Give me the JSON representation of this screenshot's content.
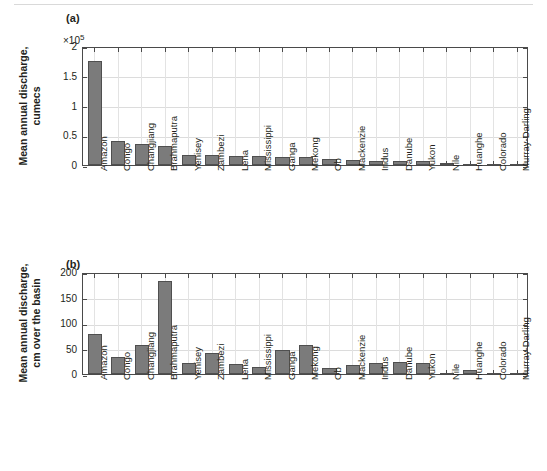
{
  "figure": {
    "panel_a_tag": "(a)",
    "panel_b_tag": "(b)"
  },
  "chart_data": [
    {
      "type": "bar",
      "panel": "(a)",
      "title": "",
      "xlabel": "",
      "ylabel": "Mean annual discharge, cumecs",
      "ylabel_line1": "Mean annual discharge,",
      "ylabel_line2": "cumecs",
      "multiplier": "×10⁵",
      "multiplier_base": "×10",
      "multiplier_exp": "5",
      "ylim": [
        0,
        2
      ],
      "yticks": [
        0,
        0.5,
        1,
        1.5,
        2
      ],
      "ytick_labels": [
        "0",
        "0.5",
        "1",
        "1.5",
        "2"
      ],
      "grid": true,
      "units": "cumecs (×10^5)",
      "categories": [
        "Amazon",
        "Congo",
        "Changjiang",
        "Brahmaputra",
        "Yenisey",
        "Zambezi",
        "Lena",
        "Mississippi",
        "Ganga",
        "Mekong",
        "Ob",
        "Mackenzie",
        "Indus",
        "Danube",
        "Yukon",
        "Nile",
        "Huanghe",
        "Colorado",
        "Murray-Darling"
      ],
      "values": [
        1.75,
        0.4,
        0.345,
        0.325,
        0.175,
        0.165,
        0.155,
        0.15,
        0.14,
        0.14,
        0.1,
        0.09,
        0.075,
        0.065,
        0.06,
        0.03,
        0.015,
        0.006,
        0.004
      ]
    },
    {
      "type": "bar",
      "panel": "(b)",
      "title": "",
      "xlabel": "",
      "ylabel": "Mean annual discharge, cm over the basin",
      "ylabel_line1": "Mean annual discharge,",
      "ylabel_line2": "cm over the basin",
      "multiplier": "",
      "ylim": [
        0,
        200
      ],
      "yticks": [
        0,
        50,
        100,
        150,
        200
      ],
      "ytick_labels": [
        "0",
        "50",
        "100",
        "150",
        "200"
      ],
      "grid": true,
      "units": "cm over the basin",
      "categories": [
        "Amazon",
        "Congo",
        "Changjiang",
        "Brahmaputra",
        "Yenisey",
        "Zambezi",
        "Lena",
        "Mississippi",
        "Ganga",
        "Mekong",
        "Ob",
        "Mackenzie",
        "Indus",
        "Danube",
        "Yukon",
        "Nile",
        "Huanghe",
        "Colorado",
        "Murray-Darling"
      ],
      "values": [
        79,
        34,
        56,
        182,
        22,
        41,
        20,
        14,
        48,
        57,
        11,
        17,
        21,
        23,
        21,
        2,
        8,
        2,
        1
      ]
    }
  ]
}
